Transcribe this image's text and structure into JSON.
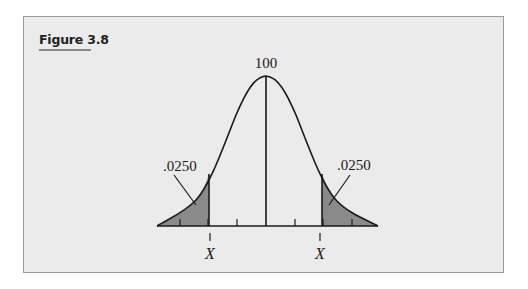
{
  "figure": {
    "title": "Figure 3.8",
    "mean_label": "100",
    "left_tail_label": ".0250",
    "right_tail_label": ".0250",
    "left_cutoff_label": "X",
    "right_cutoff_label": "X"
  },
  "colors": {
    "panel_bg": "#ebebeb",
    "shade": "#8a8a8a",
    "line": "#1a1a1a"
  }
}
